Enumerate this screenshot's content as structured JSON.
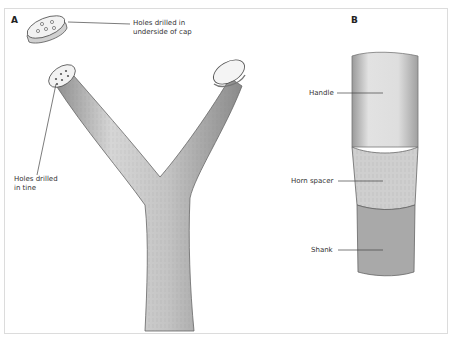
{
  "figure": {
    "panels": [
      {
        "letter": "A",
        "subject": "forked branch (Y-shaped) with removable cap",
        "labels": {
          "cap": "Holes drilled in underside of cap",
          "cap_line1": "Holes drilled in",
          "cap_line2": "underside of cap",
          "tine_line1": "Holes drilled",
          "tine_line2": "in tine"
        }
      },
      {
        "letter": "B",
        "subject": "handle joined to shank with horn spacer",
        "labels": {
          "handle": "Handle",
          "spacer": "Horn spacer",
          "shank": "Shank"
        }
      }
    ],
    "colors": {
      "border": "#dcdcdc",
      "line": "#444444",
      "wood_light": "#e9e9e9",
      "wood_mid": "#bdbdbd",
      "wood_dark": "#8a8a8a",
      "text": "#333333"
    }
  }
}
